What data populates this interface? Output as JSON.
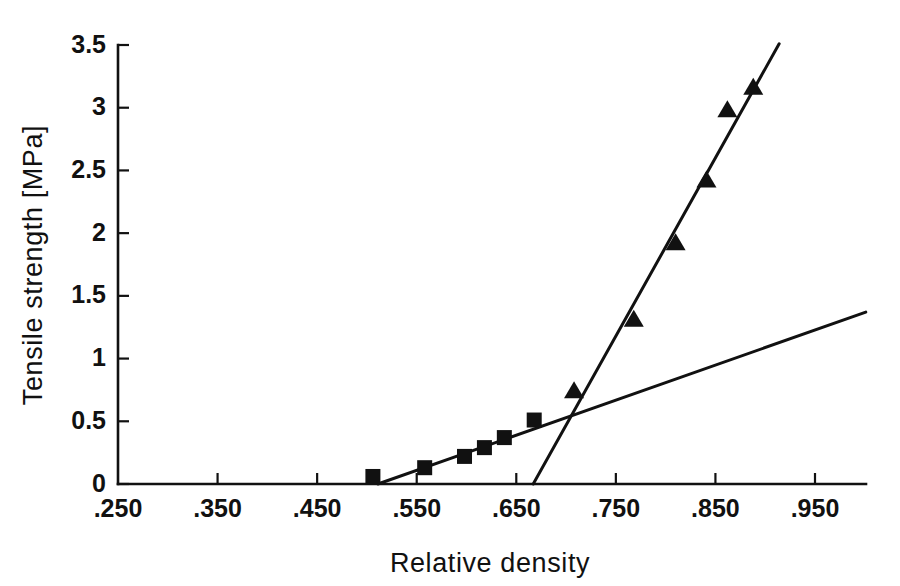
{
  "chart_data": {
    "type": "scatter",
    "title": "",
    "xlabel": "Relative density",
    "ylabel": "Tensile strength [MPa]",
    "xlim": [
      0.25,
      1.0
    ],
    "ylim": [
      0,
      3.5
    ],
    "grid": false,
    "legend": "none",
    "xticks": [
      0.25,
      0.35,
      0.45,
      0.55,
      0.65,
      0.75,
      0.85,
      0.95
    ],
    "xtick_labels": [
      ".250",
      ".350",
      ".450",
      ".550",
      ".650",
      ".750",
      ".850",
      ".950"
    ],
    "yticks": [
      0,
      0.5,
      1,
      1.5,
      2,
      2.5,
      3,
      3.5
    ],
    "ytick_labels": [
      "0",
      "0.5",
      "1",
      "1.5",
      "2",
      "2.5",
      "3",
      "3.5"
    ],
    "series": [
      {
        "name": "square-series",
        "marker": "square",
        "color": "#111111",
        "points": [
          {
            "x": 0.506,
            "y": 0.06
          },
          {
            "x": 0.558,
            "y": 0.13
          },
          {
            "x": 0.598,
            "y": 0.22
          },
          {
            "x": 0.618,
            "y": 0.29
          },
          {
            "x": 0.638,
            "y": 0.37
          },
          {
            "x": 0.668,
            "y": 0.51
          }
        ]
      },
      {
        "name": "triangle-series",
        "marker": "triangle",
        "color": "#111111",
        "points": [
          {
            "x": 0.708,
            "y": 0.74
          },
          {
            "x": 0.768,
            "y": 1.31
          },
          {
            "x": 0.81,
            "y": 1.92
          },
          {
            "x": 0.841,
            "y": 2.42
          },
          {
            "x": 0.862,
            "y": 2.98
          },
          {
            "x": 0.888,
            "y": 3.16
          }
        ]
      }
    ],
    "fit_lines": [
      {
        "name": "shallow-fit-line",
        "color": "#111111",
        "x0": 0.511,
        "y0": 0.0,
        "x1": 1.001,
        "y1": 1.37
      },
      {
        "name": "steep-fit-line",
        "color": "#111111",
        "x0": 0.667,
        "y0": 0.0,
        "x1": 0.914,
        "y1": 3.51
      }
    ]
  },
  "figure": {
    "background_color": "#ffffff",
    "ink_color": "#111111"
  }
}
